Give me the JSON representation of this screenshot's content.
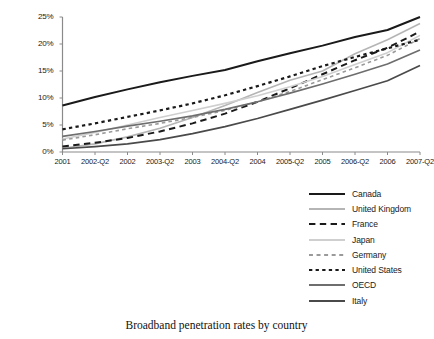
{
  "caption": "Broadband penetration rates by country",
  "chart_data": {
    "type": "line",
    "title": "Broadband penetration rates by country",
    "xlabel": "",
    "ylabel": "",
    "grid": false,
    "legend_position": "bottom-right",
    "xlim": [
      0,
      11
    ],
    "ylim": [
      0,
      25
    ],
    "ytick_labels": [
      "0%",
      "5%",
      "10%",
      "15%",
      "20%",
      "25%"
    ],
    "ytick_values": [
      0,
      5,
      10,
      15,
      20,
      25
    ],
    "categories": [
      "2001",
      "2002-Q2",
      "2002",
      "2003-Q2",
      "2003",
      "2004-Q2",
      "2004",
      "2005-Q2",
      "2005",
      "2006-Q2",
      "2006",
      "2007-Q2"
    ],
    "series": [
      {
        "name": "Canada",
        "style": "solid",
        "color": "#1a1a1a",
        "width": 2.0,
        "values": [
          8.6,
          10.2,
          11.6,
          12.9,
          14.1,
          15.2,
          16.8,
          18.3,
          19.7,
          21.3,
          22.6,
          25.0
        ]
      },
      {
        "name": "United Kingdom",
        "style": "solid",
        "color": "#b5b5b5",
        "width": 1.6,
        "values": [
          0.7,
          1.5,
          2.8,
          4.4,
          6.4,
          8.6,
          11.0,
          13.3,
          15.0,
          18.2,
          20.8,
          23.8
        ]
      },
      {
        "name": "France",
        "style": "dashed",
        "color": "#1a1a1a",
        "width": 2.0,
        "values": [
          1.0,
          1.7,
          2.6,
          3.8,
          5.3,
          7.1,
          9.3,
          11.8,
          14.4,
          17.0,
          19.3,
          22.3
        ]
      },
      {
        "name": "Japan",
        "style": "solid",
        "color": "#cfcfcf",
        "width": 1.6,
        "values": [
          2.4,
          3.6,
          5.0,
          6.4,
          7.7,
          9.0,
          10.4,
          12.1,
          14.0,
          16.2,
          18.4,
          21.6
        ]
      },
      {
        "name": "Germany",
        "style": "dotted-dash",
        "color": "#9a9a9a",
        "width": 1.6,
        "values": [
          2.2,
          3.2,
          4.3,
          5.3,
          6.4,
          7.7,
          9.3,
          11.2,
          13.4,
          15.6,
          17.9,
          21.0
        ]
      },
      {
        "name": "United States",
        "style": "dotted",
        "color": "#1a1a1a",
        "width": 2.2,
        "values": [
          4.2,
          5.3,
          6.5,
          7.7,
          9.0,
          10.5,
          12.2,
          14.0,
          15.9,
          17.6,
          19.2,
          20.8
        ]
      },
      {
        "name": "OECD",
        "style": "solid",
        "color": "#6e6e6e",
        "width": 1.7,
        "values": [
          2.9,
          3.8,
          4.8,
          5.7,
          6.7,
          7.9,
          9.3,
          10.9,
          12.6,
          14.4,
          16.3,
          18.9
        ]
      },
      {
        "name": "Italy",
        "style": "solid",
        "color": "#4a4a4a",
        "width": 1.7,
        "values": [
          0.6,
          1.0,
          1.5,
          2.3,
          3.4,
          4.7,
          6.2,
          7.9,
          9.6,
          11.4,
          13.2,
          16.0
        ]
      }
    ]
  }
}
